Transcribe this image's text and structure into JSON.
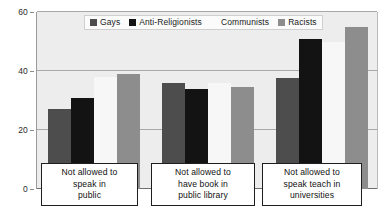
{
  "chart_data": {
    "type": "bar",
    "title": "",
    "xlabel": "",
    "ylabel": "",
    "ylim": [
      0,
      60
    ],
    "yticks": [
      0,
      20,
      40,
      60
    ],
    "grid": true,
    "legend_position": "top-center",
    "categories": [
      "Not allowed to speak in public",
      "Not allowed to have book in public library",
      "Not allowed to speak teach in universities"
    ],
    "series": [
      {
        "name": "Gays",
        "color": "#4d4d4d",
        "values": [
          27,
          36,
          37.5
        ]
      },
      {
        "name": "Anti-Religionists",
        "color": "#131313",
        "values": [
          31,
          34,
          51
        ]
      },
      {
        "name": "Communists",
        "color": "#f7f7f7",
        "values": [
          38,
          36,
          50
        ]
      },
      {
        "name": "Racists",
        "color": "#8d8d8d",
        "values": [
          39,
          34.5,
          55
        ]
      }
    ]
  },
  "axis": {
    "y_tick_labels": [
      "0",
      "20",
      "40",
      "60"
    ]
  },
  "legend": {
    "items": [
      {
        "label": "Gays"
      },
      {
        "label": "Anti-Religionists"
      },
      {
        "label": "Communists"
      },
      {
        "label": "Racists"
      }
    ]
  },
  "category_boxes": [
    {
      "lines": [
        "Not allowed to",
        "speak in",
        "public"
      ]
    },
    {
      "lines": [
        "Not allowed to",
        "have book in",
        "public library"
      ]
    },
    {
      "lines": [
        "Not allowed to",
        "speak teach in",
        "universities"
      ]
    }
  ]
}
